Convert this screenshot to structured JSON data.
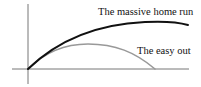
{
  "diagram": {
    "title": "",
    "axes": {
      "color": "#777777",
      "origin": [
        28,
        69
      ],
      "x_axis": {
        "from": [
          12,
          69
        ],
        "to": [
          189,
          69
        ]
      },
      "y_axis": {
        "from": [
          28,
          4
        ],
        "to": [
          28,
          84
        ]
      }
    },
    "curves": [
      {
        "name": "home-run",
        "label": "The massive home run",
        "color": "#111111",
        "width": 2,
        "path": "M28,69 C60,38 100,24 145,22 C165,21 178,22 188,25"
      },
      {
        "name": "easy-out",
        "label": "The easy out",
        "color": "#999999",
        "width": 1.6,
        "path": "M28,69 C45,52 65,44 88,44 C115,44 135,52 155,69"
      }
    ]
  }
}
